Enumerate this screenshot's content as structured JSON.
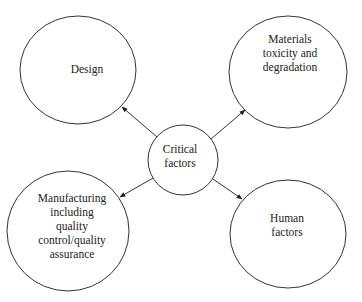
{
  "diagram": {
    "center": {
      "label_lines": [
        "Critical",
        "factors"
      ]
    },
    "nodes": [
      {
        "id": "design",
        "label_lines": [
          "Design"
        ]
      },
      {
        "id": "materials",
        "label_lines": [
          "Materials",
          "toxicity and",
          "degradation"
        ]
      },
      {
        "id": "manufacturing",
        "label_lines": [
          "Manufacturing",
          "including",
          "quality",
          "control/quality",
          "assurance"
        ]
      },
      {
        "id": "human",
        "label_lines": [
          "Human",
          "factors"
        ]
      }
    ],
    "edges": [
      {
        "from": "center",
        "to": "design"
      },
      {
        "from": "center",
        "to": "materials"
      },
      {
        "from": "center",
        "to": "manufacturing"
      },
      {
        "from": "center",
        "to": "human"
      }
    ],
    "colors": {
      "stroke": "#333333",
      "text": "#222222",
      "background": "#ffffff"
    }
  }
}
